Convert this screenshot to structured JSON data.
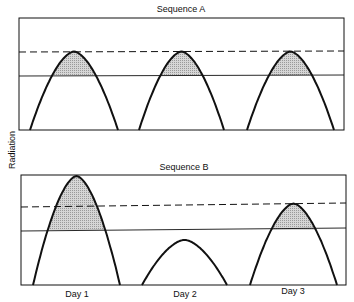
{
  "chart_data": [
    {
      "type": "line",
      "title": "Sequence A",
      "xlabel": "",
      "ylabel": "Radiation",
      "categories": [
        "Day 1",
        "Day 2",
        "Day 3"
      ],
      "series": [
        {
          "name": "Daily radiation curve",
          "peak_values": [
            0.7,
            0.7,
            0.7
          ]
        },
        {
          "name": "Upper threshold (dashed)",
          "value": 0.7
        },
        {
          "name": "Lower threshold (solid)",
          "value": 0.49
        }
      ],
      "shaded": "area of each curve above lower threshold",
      "ylim": [
        0,
        1
      ],
      "grid": false
    },
    {
      "type": "line",
      "title": "Sequence B",
      "xlabel": "",
      "ylabel": "Radiation",
      "categories": [
        "Day 1",
        "Day 2",
        "Day 3"
      ],
      "series": [
        {
          "name": "Daily radiation curve",
          "peak_values": [
            0.99,
            0.41,
            0.74
          ]
        },
        {
          "name": "Upper threshold (dashed)",
          "value": 0.72
        },
        {
          "name": "Lower threshold (solid)",
          "value": 0.5
        }
      ],
      "shaded": "area of each curve above lower threshold",
      "ylim": [
        0,
        1
      ],
      "grid": false
    }
  ],
  "labels": {
    "panel_a_title": "Sequence A",
    "panel_b_title": "Sequence B",
    "y_axis": "Radiation",
    "x_ticks": [
      "Day 1",
      "Day 2",
      "Day 3"
    ]
  }
}
